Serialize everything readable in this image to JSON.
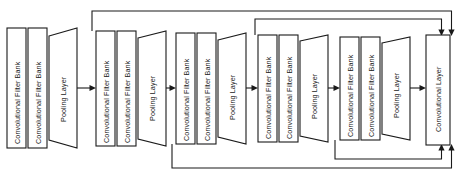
{
  "diagram": {
    "colors": {
      "stroke": "#1a1a1a",
      "fill": "#ffffff",
      "background": "#ffffff"
    },
    "labels": {
      "conv_filter_bank": "Convolutional Filter Bank",
      "pooling_layer": "Pooling Layer",
      "convolutional_layer": "Convolutional Layer"
    },
    "stages": [
      {
        "id": "stage-1",
        "index": 1,
        "top": 28,
        "bottom": 148,
        "blocks": [
          {
            "type": "rect",
            "name": "conv-filter-bank",
            "label": "Convolutional Filter Bank",
            "x": 7,
            "width": 19
          },
          {
            "type": "rect",
            "name": "conv-filter-bank",
            "label": "Convolutional Filter Bank",
            "x": 28,
            "width": 19
          },
          {
            "type": "trapezoid",
            "name": "pooling-layer",
            "label": "Pooling Layer",
            "x": 49,
            "width": 28
          }
        ]
      },
      {
        "id": "stage-2",
        "index": 2,
        "top": 31,
        "bottom": 146,
        "blocks": [
          {
            "type": "rect",
            "name": "conv-filter-bank",
            "label": "Convolutional Filter Bank",
            "x": 96,
            "width": 19
          },
          {
            "type": "rect",
            "name": "conv-filter-bank",
            "label": "Convolutional Filter Bank",
            "x": 117,
            "width": 19
          },
          {
            "type": "trapezoid",
            "name": "pooling-layer",
            "label": "Pooling Layer",
            "x": 138,
            "width": 28
          }
        ]
      },
      {
        "id": "stage-3",
        "index": 3,
        "top": 33,
        "bottom": 144,
        "blocks": [
          {
            "type": "rect",
            "name": "conv-filter-bank",
            "label": "Convolutional Filter Bank",
            "x": 176,
            "width": 19
          },
          {
            "type": "rect",
            "name": "conv-filter-bank",
            "label": "Convolutional Filter Bank",
            "x": 197,
            "width": 19
          },
          {
            "type": "trapezoid",
            "name": "pooling-layer",
            "label": "Pooling Layer",
            "x": 218,
            "width": 28
          }
        ]
      },
      {
        "id": "stage-4",
        "index": 4,
        "top": 35,
        "bottom": 142,
        "blocks": [
          {
            "type": "rect",
            "name": "conv-filter-bank",
            "label": "Convolutional Filter Bank",
            "x": 258,
            "width": 19
          },
          {
            "type": "rect",
            "name": "conv-filter-bank",
            "label": "Convolutional Filter Bank",
            "x": 279,
            "width": 19
          },
          {
            "type": "trapezoid",
            "name": "pooling-layer",
            "label": "Pooling Layer",
            "x": 300,
            "width": 28
          }
        ]
      },
      {
        "id": "stage-5",
        "index": 5,
        "top": 37,
        "bottom": 140,
        "blocks": [
          {
            "type": "rect",
            "name": "conv-filter-bank",
            "label": "Convolutional Filter Bank",
            "x": 340,
            "width": 19
          },
          {
            "type": "rect",
            "name": "conv-filter-bank",
            "label": "Convolutional Filter Bank",
            "x": 361,
            "width": 19
          },
          {
            "type": "trapezoid",
            "name": "pooling-layer",
            "label": "Pooling Layer",
            "x": 382,
            "width": 28
          }
        ]
      }
    ],
    "output_block": {
      "id": "output-conv-layer",
      "name": "convolutional-layer",
      "label": "Convolutional Layer",
      "x": 426,
      "width": 24,
      "top": 35,
      "bottom": 145
    },
    "connections": [
      {
        "name": "stage1-to-stage2",
        "type": "forward-arrow"
      },
      {
        "name": "stage2-to-stage3",
        "type": "forward-arrow"
      },
      {
        "name": "stage3-to-stage4",
        "type": "forward-arrow"
      },
      {
        "name": "stage4-to-stage5",
        "type": "forward-arrow"
      },
      {
        "name": "stage5-to-output",
        "type": "forward-arrow"
      },
      {
        "name": "skip-stage2-top-to-output",
        "type": "skip-top-arrow"
      },
      {
        "name": "skip-stage4-top-to-output",
        "type": "skip-top-arrow"
      },
      {
        "name": "skip-stage3-bottom-to-output",
        "type": "skip-bottom-arrow"
      },
      {
        "name": "skip-stage5-bottom-to-output",
        "type": "skip-bottom-arrow"
      }
    ]
  }
}
